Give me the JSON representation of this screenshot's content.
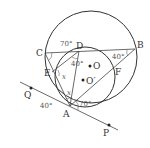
{
  "diagram": {
    "points": {
      "A": "A",
      "B": "B",
      "C": "C",
      "D": "D",
      "E": "E",
      "F": "F",
      "O": "O",
      "O_prime": "O′",
      "P": "P",
      "Q": "Q"
    },
    "angles": {
      "angle_C": "70°",
      "angle_D": "40°",
      "angle_B": "40°",
      "angle_A_right": "70°",
      "angle_A_tangent": "40°",
      "var_E": "x",
      "var_A": "x"
    }
  }
}
